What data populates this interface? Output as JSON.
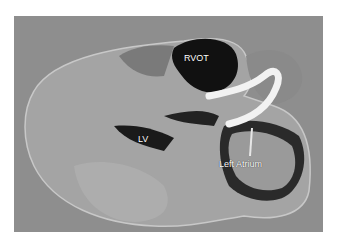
{
  "image": {
    "description": "Grayscale photograph of a sectioned heart specimen with white probe",
    "labels": {
      "rvot": "RVOT",
      "lv": "LV",
      "left_atrium": "Left Atrium"
    },
    "colors": {
      "background": "#8e8e8e",
      "tissue": "#a6a6a6",
      "cavity": "#111111",
      "probe": "#f2f2f2"
    }
  }
}
